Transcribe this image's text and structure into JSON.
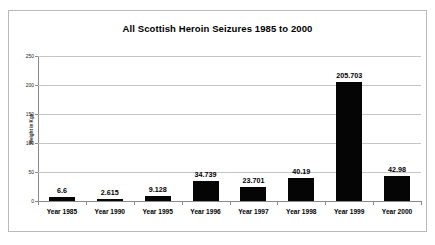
{
  "chart_data": {
    "type": "bar",
    "title": "All Scottish Heroin Seizures 1985 to 2000",
    "xlabel": "",
    "ylabel": "Weight in Kgs",
    "categories": [
      "Year 1985",
      "Year 1990",
      "Year 1995",
      "Year 1996",
      "Year 1997",
      "Year 1998",
      "Year 1999",
      "Year 2000"
    ],
    "values": [
      6.6,
      2.615,
      9.128,
      34.739,
      23.701,
      40.19,
      205.703,
      42.98
    ],
    "value_labels": [
      "6.6",
      "2.615",
      "9.128",
      "34.739",
      "23.701",
      "40.19",
      "205.703",
      "42.98"
    ],
    "ylim": [
      0,
      250
    ],
    "yticks": [
      0,
      50,
      100,
      150,
      200,
      250
    ],
    "ytick_labels": [
      "0",
      "50",
      "100",
      "150",
      "200",
      "250"
    ],
    "grid": true,
    "legend": false,
    "legend_position": "none",
    "bar_color": "#050505",
    "grid_color": "#c6c6c6",
    "axis_color": "#8a8a8a",
    "frame_color": "#b9b9b9",
    "background": "#ffffff"
  }
}
